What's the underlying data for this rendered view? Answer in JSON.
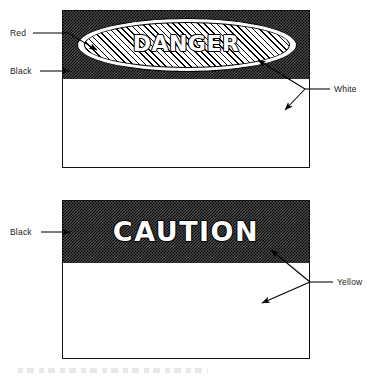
{
  "diagram": {
    "type": "safety-sign-color-specification",
    "signs": [
      {
        "id": "danger",
        "word": "DANGER",
        "header_band_color_name": "Black",
        "shape_color_name": "Red",
        "accent_color_name": "White",
        "body_color_name": "White",
        "callouts": [
          {
            "key": "red",
            "label": "Red",
            "target": "oval-interior"
          },
          {
            "key": "black",
            "label": "Black",
            "target": "header-band"
          },
          {
            "key": "white",
            "label": "White",
            "target": "oval-ring-and-body"
          }
        ]
      },
      {
        "id": "caution",
        "word": "CAUTION",
        "header_band_color_name": "Black",
        "accent_color_name": "Yellow",
        "body_color_name": "Yellow",
        "callouts": [
          {
            "key": "black",
            "label": "Black",
            "target": "header-band"
          },
          {
            "key": "yellow",
            "label": "Yellow",
            "target": "letters-and-body"
          }
        ]
      }
    ],
    "labels": {
      "danger_red": "Red",
      "danger_black": "Black",
      "danger_white": "White",
      "caution_black": "Black",
      "caution_yellow": "Yellow"
    },
    "colors": {
      "ink": "#000000",
      "paper": "#ffffff",
      "band_dither": "#4a4a4a"
    }
  }
}
